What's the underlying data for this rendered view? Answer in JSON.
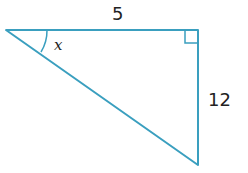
{
  "diagram": {
    "type": "right-triangle",
    "stroke_color": "#3a9fbf",
    "labels": {
      "top_side": "5",
      "right_side": "12",
      "angle": "x"
    },
    "right_angle_marker": true
  }
}
